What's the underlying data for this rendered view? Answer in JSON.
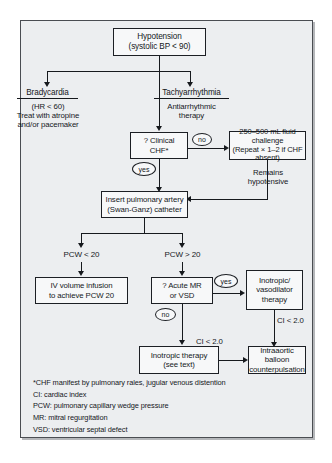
{
  "diagram": {
    "nodes": {
      "root": "Hypotension\n(systolic BP < 90)",
      "bradycardia_head": "Bradycardia",
      "bradycardia_body": "(HR < 60)\nTreat with atropine\nand/or pacemaker",
      "tachyarrhythmia_head": "Tachyarrhythmia",
      "tachyarrhythmia_body": "Antiarrhythmic\ntherapy",
      "clinical_chf": "? Clinical\nCHF*",
      "fluid_challenge": "250–500 mL fluid challenge\n(Repeat × 1–2 if CHF absent)",
      "remains_hypotensive": "Remains\nhypotensive",
      "swan_ganz": "Insert pulmonary artery\n(Swan-Ganz) catheter",
      "pcw_low": "PCW < 20",
      "pcw_high": "PCW > 20",
      "iv_volume": "IV volume infusion\nto achieve PCW 20",
      "acute_mr_vsd": "? Acute MR\nor VSD",
      "inotropic_vasodilator": "Inotropic/\nvasodilator\ntherapy",
      "inotropic_therapy": "Inotropic therapy\n(see text)",
      "balloon": "Intraaortic balloon\ncounterpulsation"
    },
    "edge_labels": {
      "no_chf": "no",
      "yes_chf": "yes",
      "yes_mr": "yes",
      "no_mr": "no",
      "ci_center": "CI < 2.0",
      "ci_right": "CI < 2.0"
    },
    "legend": [
      "*CHF manifest by pulmonary rales, jugular venous distention",
      "CI: cardiac index",
      "PCW: pulmonary capillary wedge pressure",
      "MR: mitral regurgitation",
      "VSD: ventricular septal defect"
    ]
  },
  "colors": {
    "page_background": "#ffffff",
    "frame_background": "#eceef0",
    "frame_border": "#4a4d52",
    "node_fill": "#f7f8f9",
    "node_border": "#1c1f24",
    "ink": "#15181c"
  }
}
